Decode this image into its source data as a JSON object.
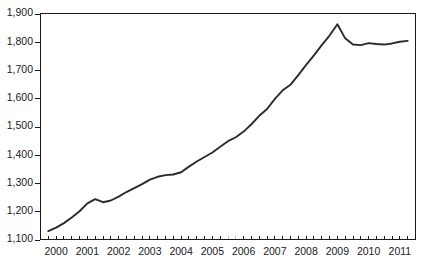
{
  "chart_data": {
    "type": "line",
    "title": "",
    "subtitle": "",
    "xlabel": "",
    "ylabel": "",
    "ylim": [
      1100,
      1900
    ],
    "xlim": [
      1999.75,
      2011.75
    ],
    "grid": false,
    "legend": null,
    "y_ticks": [
      1100,
      1200,
      1300,
      1400,
      1500,
      1600,
      1700,
      1800,
      1900
    ],
    "y_tick_labels": [
      "1,100",
      "1,200",
      "1,300",
      "1,400",
      "1,500",
      "1,600",
      "1,700",
      "1,800",
      "1,900"
    ],
    "x_ticks": [
      2000,
      2001,
      2002,
      2003,
      2004,
      2005,
      2006,
      2007,
      2008,
      2009,
      2010,
      2011
    ],
    "x_tick_labels": [
      "2000",
      "2001",
      "2002",
      "2003",
      "2004",
      "2005",
      "2006",
      "2007",
      "2008",
      "2009",
      "2010",
      "2011"
    ],
    "x_minor_ticks_per_year": 4,
    "line_color": "#2b2b2b",
    "axis_color": "#1a1a1a",
    "background_color": "#ffffff",
    "series": [
      {
        "name": "series-1",
        "x": [
          2000.0,
          2000.25,
          2000.5,
          2000.75,
          2001.0,
          2001.25,
          2001.5,
          2001.75,
          2002.0,
          2002.25,
          2002.5,
          2002.75,
          2003.0,
          2003.25,
          2003.5,
          2003.75,
          2004.0,
          2004.25,
          2004.5,
          2004.75,
          2005.0,
          2005.25,
          2005.5,
          2005.75,
          2006.0,
          2006.25,
          2006.5,
          2006.75,
          2007.0,
          2007.25,
          2007.5,
          2007.75,
          2008.0,
          2008.25,
          2008.5,
          2008.75,
          2009.0,
          2009.25,
          2009.5,
          2009.75,
          2010.0,
          2010.25,
          2010.5,
          2010.75,
          2011.0,
          2011.25,
          2011.5
        ],
        "values": [
          1130,
          1142,
          1158,
          1178,
          1200,
          1228,
          1243,
          1232,
          1238,
          1252,
          1268,
          1282,
          1296,
          1312,
          1322,
          1328,
          1330,
          1338,
          1358,
          1376,
          1392,
          1408,
          1428,
          1448,
          1462,
          1482,
          1508,
          1538,
          1562,
          1598,
          1628,
          1648,
          1682,
          1718,
          1752,
          1788,
          1822,
          1862,
          1812,
          1790,
          1788,
          1795,
          1792,
          1790,
          1794,
          1800,
          1803
        ]
      }
    ]
  }
}
